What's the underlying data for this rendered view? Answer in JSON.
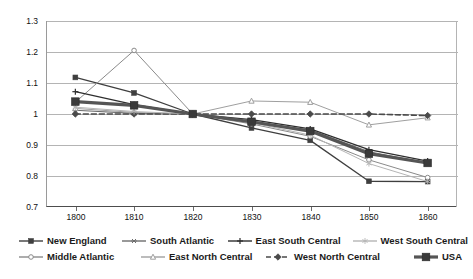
{
  "chart_data": {
    "type": "line",
    "title": "",
    "xlabel": "",
    "ylabel": "",
    "x": [
      1800,
      1810,
      1820,
      1830,
      1840,
      1850,
      1860
    ],
    "xlim": [
      1795,
      1865
    ],
    "ylim": [
      0.7,
      1.3
    ],
    "ytick_labels": [
      "1.3",
      "1.2",
      "1.1",
      "1",
      "0.9",
      "0.8",
      "0.7"
    ],
    "ytick_values": [
      1.3,
      1.2,
      1.1,
      1.0,
      0.9,
      0.8,
      0.7
    ],
    "xtick_labels": [
      "1800",
      "1810",
      "1820",
      "1830",
      "1840",
      "1850",
      "1860"
    ],
    "grid": "horizontal",
    "legend_position": "bottom",
    "series": [
      {
        "name": "New England",
        "marker": "square",
        "color": "#3f3f3f",
        "width": 1.3,
        "dash": "none",
        "values": [
          1.118,
          1.068,
          1.0,
          0.955,
          0.915,
          0.783,
          0.782
        ]
      },
      {
        "name": "Middle Atlantic",
        "marker": "circle-open",
        "color": "#8a8a8a",
        "width": 1.0,
        "dash": "none",
        "values": [
          1.038,
          1.205,
          1.0,
          0.968,
          0.928,
          0.852,
          0.795
        ]
      },
      {
        "name": "South Atlantic",
        "marker": "asterisk",
        "color": "#6e6e6e",
        "width": 1.1,
        "dash": "none",
        "values": [
          1.012,
          1.002,
          1.0,
          0.972,
          0.948,
          0.878,
          0.842
        ]
      },
      {
        "name": "East North Central",
        "marker": "triangle-open",
        "color": "#9f9f9f",
        "width": 1.0,
        "dash": "none",
        "values": [
          1.018,
          1.005,
          1.0,
          1.042,
          1.038,
          0.965,
          0.988
        ]
      },
      {
        "name": "East South Central",
        "marker": "plus",
        "color": "#2e2e2e",
        "width": 1.2,
        "dash": "none",
        "values": [
          1.072,
          1.03,
          1.0,
          0.982,
          0.952,
          0.885,
          0.848
        ]
      },
      {
        "name": "West North Central",
        "marker": "diamond",
        "color": "#4a4a4a",
        "width": 1.6,
        "dash": "dashed",
        "values": [
          1.0,
          1.0,
          1.0,
          1.0,
          1.0,
          1.0,
          0.995
        ]
      },
      {
        "name": "West South Central",
        "marker": "star",
        "color": "#b5b5b5",
        "width": 1.0,
        "dash": "none",
        "values": [
          1.022,
          1.008,
          1.0,
          0.972,
          0.932,
          0.84,
          0.782
        ]
      },
      {
        "name": "USA",
        "marker": "square-large",
        "color": "#555555",
        "width": 3.2,
        "dash": "none",
        "values": [
          1.04,
          1.028,
          1.0,
          0.975,
          0.945,
          0.872,
          0.842
        ]
      }
    ]
  },
  "legend": {
    "rows": [
      [
        "New England",
        "South Atlantic",
        "East South Central",
        "West South Central"
      ],
      [
        "Middle Atlantic",
        "East North Central",
        "West North Central",
        "USA"
      ]
    ]
  },
  "colors": {
    "grid": "#b4b4b4",
    "axis": "#4d4d4d",
    "text": "#111111",
    "background": "#ffffff"
  }
}
